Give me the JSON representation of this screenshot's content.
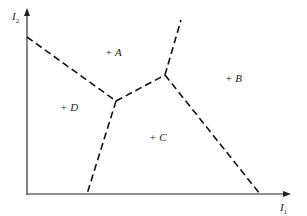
{
  "diagram": {
    "type": "decision-regions",
    "axes": {
      "x": {
        "label": "I",
        "subscript": "1"
      },
      "y": {
        "label": "I",
        "subscript": "2"
      }
    },
    "regions": [
      {
        "id": "A",
        "label": "+ A"
      },
      {
        "id": "B",
        "label": "+ B"
      },
      {
        "id": "C",
        "label": "+ C"
      },
      {
        "id": "D",
        "label": "+ D"
      }
    ],
    "boundaries": [
      {
        "between": [
          "A",
          "D"
        ],
        "style": "dashed"
      },
      {
        "between": [
          "A",
          "C"
        ],
        "style": "dashed"
      },
      {
        "between": [
          "A",
          "B"
        ],
        "style": "dashed"
      },
      {
        "between": [
          "B",
          "C"
        ],
        "style": "dashed"
      },
      {
        "between": [
          "C",
          "D"
        ],
        "style": "dashed"
      }
    ],
    "colors": {
      "line": "#111111",
      "background": "#ffffff"
    }
  }
}
